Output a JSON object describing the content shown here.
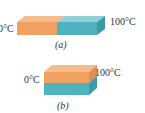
{
  "figure_a": {
    "left_label": "0°C",
    "right_label": "100°C",
    "caption": "(a)",
    "colors": {
      "hot_front": "#f0a060",
      "hot_top": "#f5bd8a",
      "cold_front": "#4fb3bf",
      "cold_top": "#8fd0d8",
      "cold_side": "#3d9aa6"
    }
  },
  "figure_b": {
    "left_label": "0°C",
    "right_label": "100°C",
    "caption": "(b)",
    "colors": {
      "hot_front": "#f0a060",
      "hot_top": "#f5bd8a",
      "hot_side": "#e0904e",
      "cold_front": "#4fb3bf",
      "cold_side": "#3d9aa6"
    }
  }
}
